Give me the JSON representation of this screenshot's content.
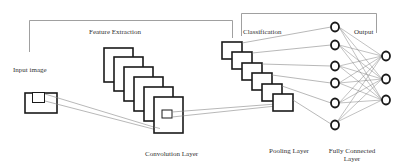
{
  "diagram": {
    "type": "cnn-architecture",
    "labels": {
      "input_image": "Input image",
      "feature_extraction": "Feature Extraction",
      "convolution_layer": "Convolution Layer",
      "pooling_layer": "Pooling Layer",
      "classification": "Classification",
      "output": "Output",
      "fully_connected_line1": "Fully Connected",
      "fully_connected_line2": "Layer"
    },
    "sections": [
      {
        "name": "Feature Extraction",
        "contains": [
          "Input image",
          "Convolution Layer"
        ]
      },
      {
        "name": "Classification",
        "contains": [
          "Pooling Layer",
          "Fully Connected Layer"
        ]
      }
    ],
    "convolution_feature_maps": 6,
    "pooling_feature_maps": 6,
    "fully_connected_nodes": 6,
    "output_nodes": 3,
    "colors": {
      "stroke": "#1a1a1a",
      "thin_line": "#777777",
      "text": "#333333",
      "background": "#ffffff"
    }
  }
}
